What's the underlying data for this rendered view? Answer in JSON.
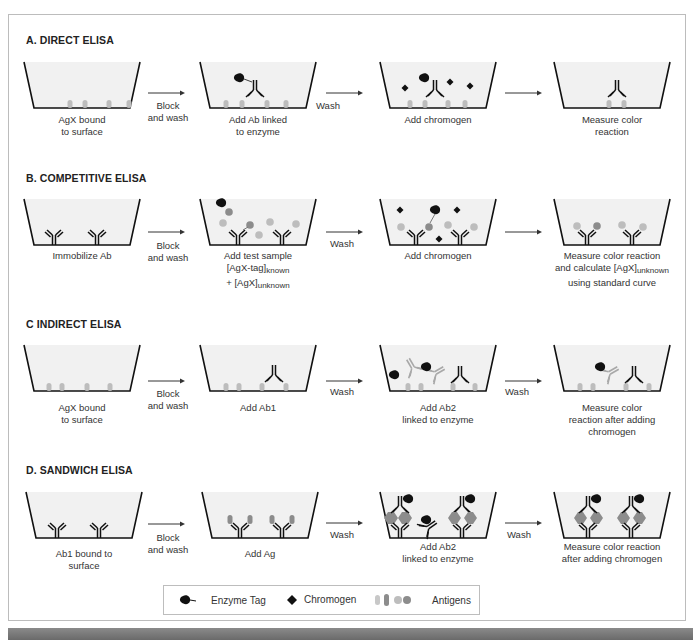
{
  "sections": [
    {
      "title": "A.  DIRECT ELISA",
      "steps": [
        {
          "caption": [
            "AgX bound",
            "to surface"
          ]
        },
        {
          "caption": [
            "Add Ab linked",
            "to enzyme"
          ]
        },
        {
          "caption": [
            "Add chromogen"
          ]
        },
        {
          "caption": [
            "Measure color",
            "reaction"
          ]
        }
      ],
      "arrows": [
        [
          "Block",
          "and wash"
        ],
        [
          "Wash"
        ],
        [
          ""
        ]
      ]
    },
    {
      "title": "B.  COMPETITIVE ELISA",
      "steps": [
        {
          "caption": [
            "Immobilize Ab"
          ]
        },
        {
          "caption": [
            "Add test sample",
            "[AgX-tag]known",
            "+ [AgX]unknown"
          ]
        },
        {
          "caption": [
            "Add chromogen"
          ]
        },
        {
          "caption": [
            "Measure color reaction",
            "and calculate [AgX]unknown",
            "using standard curve"
          ]
        }
      ],
      "arrows": [
        [
          "Block",
          "and wash"
        ],
        [
          "Wash"
        ],
        [
          ""
        ]
      ]
    },
    {
      "title": "C  INDIRECT ELISA",
      "steps": [
        {
          "caption": [
            "AgX bound",
            "to surface"
          ]
        },
        {
          "caption": [
            "Add Ab1"
          ]
        },
        {
          "caption": [
            "Add Ab2",
            "linked to enzyme"
          ]
        },
        {
          "caption": [
            "Measure color",
            "reaction after adding",
            "chromogen"
          ]
        }
      ],
      "arrows": [
        [
          "Block",
          "and wash"
        ],
        [
          "Wash"
        ],
        [
          "Wash"
        ]
      ]
    },
    {
      "title": "D.  SANDWICH ELISA",
      "steps": [
        {
          "caption": [
            "Ab1 bound to",
            "surface"
          ]
        },
        {
          "caption": [
            "Add Ag"
          ]
        },
        {
          "caption": [
            "Add Ab2",
            "linked to enzyme"
          ]
        },
        {
          "caption": [
            "Measure color reaction",
            "after adding chromogen"
          ]
        }
      ],
      "arrows": [
        [
          "Block",
          "and wash"
        ],
        [
          "Wash"
        ],
        [
          "Wash"
        ]
      ]
    }
  ],
  "legend": {
    "enzyme_tag": "Enzyme Tag",
    "chromogen": "Chromogen",
    "antigens": "Antigens"
  },
  "colors": {
    "antigen_light": "#bdbdbd",
    "antigen_dark": "#8c8c8c",
    "antibody": "#111111",
    "ab2_gray": "#a8a8a8",
    "well_fill": "#f1f1f1"
  }
}
